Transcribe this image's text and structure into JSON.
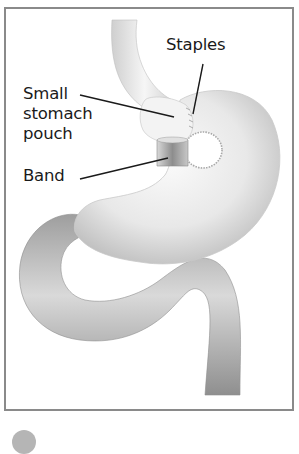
{
  "diagram": {
    "labels": {
      "staples": "Staples",
      "pouch_line1": "Small",
      "pouch_line2": "stomach",
      "pouch_line3": "pouch",
      "band": "Band"
    },
    "structures": [
      "esophagus",
      "small stomach pouch",
      "band",
      "staples",
      "stomach",
      "intestine"
    ],
    "colors": {
      "frame_border": "#8a8a8a",
      "label_text": "#1a1a1a",
      "leader_line": "#1a1a1a",
      "organ_light": "#f2f2f2",
      "organ_shade": "#9a9a9a"
    }
  },
  "footer": {
    "icon": "number-badge-icon"
  }
}
